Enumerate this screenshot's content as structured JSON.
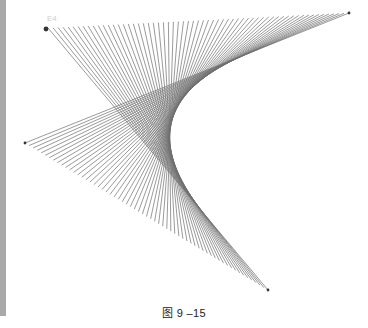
{
  "figure": {
    "caption": "图 9 –15",
    "faint_label": "E4",
    "line_color": "#6e6e6e",
    "point_color": "#333333",
    "sidebar_color": "#a9a9a9",
    "line_count": 60
  },
  "geometry": {
    "segment_a": {
      "start": [
        48,
        28
      ],
      "end": [
        349,
        13
      ]
    },
    "segment_b": {
      "start": [
        268,
        290
      ],
      "end": [
        25,
        143
      ]
    },
    "points": [
      {
        "name": "top-left",
        "xy": [
          46,
          29
        ]
      },
      {
        "name": "top-right",
        "xy": [
          349,
          13
        ]
      },
      {
        "name": "left",
        "xy": [
          25,
          143
        ]
      },
      {
        "name": "bottom",
        "xy": [
          268,
          290
        ]
      }
    ]
  }
}
